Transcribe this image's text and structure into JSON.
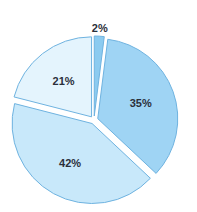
{
  "chart_data": {
    "type": "pie",
    "title": "",
    "categories": [
      "A",
      "B",
      "C",
      "D"
    ],
    "values": [
      2,
      35,
      42,
      21
    ],
    "labels": [
      "2%",
      "35%",
      "42%",
      "21%"
    ],
    "colors": [
      "#8ccbf0",
      "#9fd4f4",
      "#c8e8fa",
      "#e4f4fd"
    ],
    "stroke": "#6fb3e0",
    "start_angle_deg": 0,
    "direction": "clockwise",
    "exploded": true,
    "legend": false
  }
}
